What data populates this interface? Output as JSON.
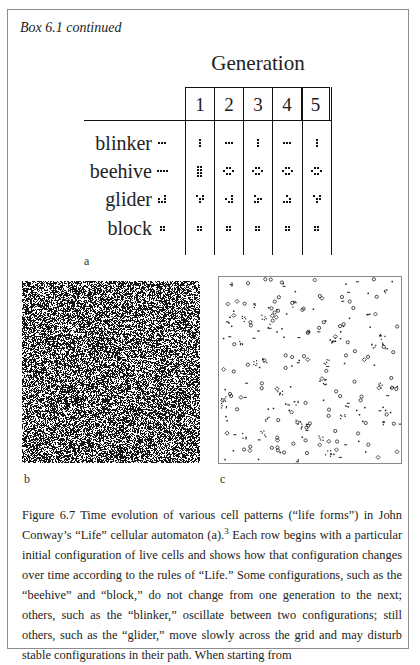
{
  "box": {
    "title": "Box 6.1 continued"
  },
  "figure_a": {
    "header": "Generation",
    "generations": [
      "1",
      "2",
      "3",
      "4",
      "5"
    ],
    "rows": [
      {
        "label": "blinker",
        "initial": [
          "XXX"
        ],
        "states": [
          [
            "X",
            "X",
            "X"
          ],
          [
            "XXX"
          ],
          [
            "X",
            "X",
            "X"
          ],
          [
            "XXX"
          ],
          [
            "X",
            "X",
            "X"
          ]
        ]
      },
      {
        "label": "beehive",
        "initial": [
          "XXXX"
        ],
        "states": [
          [
            "XX",
            "XX",
            "XX",
            "XX"
          ],
          [
            ".XX.",
            "X..X",
            ".XX."
          ],
          [
            ".XX.",
            "X..X",
            ".XX."
          ],
          [
            ".XX.",
            "X..X",
            ".XX."
          ],
          [
            ".XX.",
            "X..X",
            ".XX."
          ]
        ]
      },
      {
        "label": "glider",
        "initial": [
          "..X",
          "X.X",
          "XXX"
        ],
        "states": [
          [
            "X.X",
            ".XX",
            ".X."
          ],
          [
            "..X",
            "X.X",
            ".XX"
          ],
          [
            "X..",
            ".XX",
            "XX."
          ],
          [
            ".X.",
            "..X",
            "XXX"
          ],
          [
            "X.X",
            ".XX",
            ".X."
          ]
        ]
      },
      {
        "label": "block",
        "initial": [
          "XX",
          "XX"
        ],
        "states": [
          [
            "XX",
            "XX"
          ],
          [
            "XX",
            "XX"
          ],
          [
            "XX",
            "XX"
          ],
          [
            "XX",
            "XX"
          ],
          [
            "XX",
            "XX"
          ]
        ]
      }
    ],
    "label": "a"
  },
  "figure_b": {
    "label": "b",
    "description": "dense random field of live cells (initial state)"
  },
  "figure_c": {
    "label": "c",
    "description": "sparse field of stable and oscillating life forms after many generations"
  },
  "caption": {
    "part1": "Figure 6.7 Time evolution of various cell patterns (“life forms”) in John Conway’s “Life” cellular automaton (a).",
    "footnote": "3",
    "part2": " Each row begins with a particular initial configuration of live cells and shows how that configuration changes over time according to the rules of “Life.” Some configurations, such as the “beehive” and “block,” do not change from one generation to the next; others, such as the “blinker,” oscillate between two configurations; still others, such as the “glider,” move slowly across the grid and may disturb stable configurations in their path. When starting from"
  }
}
